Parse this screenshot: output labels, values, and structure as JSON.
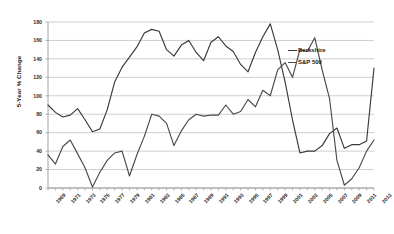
{
  "chart_data": {
    "type": "line",
    "title": "",
    "xlabel": "",
    "ylabel": "5-Year % Change",
    "ylim": [
      0,
      180
    ],
    "ytick_step": 20,
    "grid": true,
    "legend_position": "inside-right",
    "yticks": [
      "0",
      "20",
      "40",
      "60",
      "80",
      "100",
      "120",
      "140",
      "160",
      "180"
    ],
    "x": [
      1969,
      1970,
      1971,
      1972,
      1973,
      1974,
      1975,
      1976,
      1977,
      1978,
      1979,
      1980,
      1981,
      1982,
      1983,
      1984,
      1985,
      1986,
      1987,
      1988,
      1989,
      1990,
      1991,
      1992,
      1993,
      1994,
      1995,
      1996,
      1997,
      1998,
      1999,
      2000,
      2001,
      2002,
      2003,
      2004,
      2005,
      2006,
      2007,
      2008,
      2009,
      2010,
      2011,
      2012,
      2013
    ],
    "xtick_labels": [
      "1969",
      "1971",
      "1973",
      "1975",
      "1977",
      "1979",
      "1981",
      "1983",
      "1985",
      "1987",
      "1989",
      "1991",
      "1993",
      "1995",
      "1997",
      "1999",
      "2001",
      "2003",
      "2005",
      "2007",
      "2009",
      "2011",
      "2013"
    ],
    "series": [
      {
        "name": "Berkshire",
        "color": "#3a3a3a",
        "values": [
          90,
          82,
          77,
          79,
          86,
          74,
          61,
          64,
          85,
          115,
          131,
          142,
          153,
          168,
          172,
          170,
          150,
          143,
          155,
          160,
          147,
          138,
          158,
          164,
          154,
          148,
          134,
          126,
          147,
          164,
          178,
          150,
          115,
          74,
          38,
          40,
          40,
          46,
          59,
          65,
          43,
          47,
          47,
          51,
          130
        ]
      },
      {
        "name": "S&P 500",
        "color": "#4a4a4a",
        "values": [
          36,
          26,
          45,
          52,
          37,
          22,
          1,
          17,
          30,
          38,
          40,
          13,
          36,
          56,
          80,
          78,
          70,
          46,
          62,
          74,
          80,
          78,
          79,
          79,
          90,
          80,
          83,
          96,
          88,
          106,
          100,
          128,
          136,
          120,
          150,
          148,
          163,
          128,
          97,
          30,
          3,
          10,
          22,
          40,
          52
        ]
      }
    ]
  },
  "legend": {
    "items": [
      {
        "label": "Berkshire"
      },
      {
        "label": "S&P 500"
      }
    ]
  }
}
